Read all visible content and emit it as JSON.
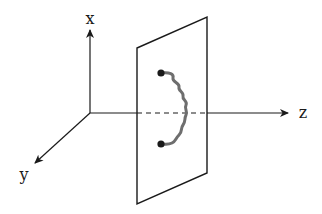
{
  "diagram": {
    "axes": {
      "x": {
        "label": "x"
      },
      "y": {
        "label": "y"
      },
      "z": {
        "label": "z"
      }
    },
    "plane": {
      "label": ""
    },
    "string": {
      "endpoints": 2,
      "color": "#6e6e6e"
    },
    "colors": {
      "line": "#1a1a1a",
      "string": "#6e6e6e",
      "background": "#ffffff"
    }
  }
}
